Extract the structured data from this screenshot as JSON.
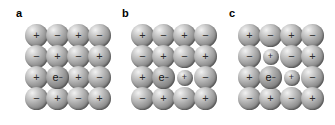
{
  "figure": {
    "width": 335,
    "height": 125,
    "background": "#ffffff"
  },
  "panels": [
    {
      "id": "panel-a",
      "label": "a",
      "left": 0,
      "rows": 4,
      "cols": 4,
      "cells": [
        [
          {
            "charge": "+",
            "size": "big"
          },
          {
            "charge": "−",
            "size": "big"
          },
          {
            "charge": "+",
            "size": "big"
          },
          {
            "charge": "−",
            "size": "big"
          }
        ],
        [
          {
            "charge": "−",
            "size": "big"
          },
          {
            "charge": "+",
            "size": "big"
          },
          {
            "charge": "−",
            "size": "big"
          },
          {
            "charge": "+",
            "size": "big"
          }
        ],
        [
          {
            "charge": "+",
            "size": "big"
          },
          {
            "charge": "e",
            "size": "big",
            "electron": true
          },
          {
            "charge": "+",
            "size": "big"
          },
          {
            "charge": "−",
            "size": "big"
          }
        ],
        [
          {
            "charge": "−",
            "size": "big"
          },
          {
            "charge": "+",
            "size": "big"
          },
          {
            "charge": "−",
            "size": "big"
          },
          {
            "charge": "+",
            "size": "big"
          }
        ]
      ]
    },
    {
      "id": "panel-b",
      "label": "b",
      "left": 106,
      "rows": 4,
      "cols": 4,
      "cells": [
        [
          {
            "charge": "+",
            "size": "big"
          },
          {
            "charge": "−",
            "size": "big"
          },
          {
            "charge": "+",
            "size": "big"
          },
          {
            "charge": "−",
            "size": "big"
          }
        ],
        [
          {
            "charge": "−",
            "size": "big"
          },
          {
            "charge": "+",
            "size": "big"
          },
          {
            "charge": "−",
            "size": "big"
          },
          {
            "charge": "+",
            "size": "big"
          }
        ],
        [
          {
            "charge": "+",
            "size": "big"
          },
          {
            "charge": "e",
            "size": "big",
            "electron": true
          },
          {
            "charge": "+",
            "size": "small"
          },
          {
            "charge": "−",
            "size": "big"
          }
        ],
        [
          {
            "charge": "−",
            "size": "big"
          },
          {
            "charge": "+",
            "size": "big"
          },
          {
            "charge": "−",
            "size": "big"
          },
          {
            "charge": "+",
            "size": "big"
          }
        ]
      ]
    },
    {
      "id": "panel-c",
      "label": "c",
      "left": 213,
      "rows": 4,
      "cols": 4,
      "cells": [
        [
          {
            "charge": "+",
            "size": "big"
          },
          {
            "charge": "−",
            "size": "big"
          },
          {
            "charge": "+",
            "size": "big"
          },
          {
            "charge": "−",
            "size": "big"
          }
        ],
        [
          {
            "charge": "−",
            "size": "big"
          },
          {
            "charge": "+",
            "size": "small"
          },
          {
            "charge": "−",
            "size": "big"
          },
          {
            "charge": "+",
            "size": "big"
          }
        ],
        [
          {
            "charge": "+",
            "size": "big"
          },
          {
            "charge": "e",
            "size": "big",
            "electron": true
          },
          {
            "charge": "+",
            "size": "small"
          },
          {
            "charge": "−",
            "size": "big"
          }
        ],
        [
          {
            "charge": "−",
            "size": "big"
          },
          {
            "charge": "+",
            "size": "big"
          },
          {
            "charge": "−",
            "size": "big"
          },
          {
            "charge": "+",
            "size": "big"
          }
        ]
      ]
    }
  ],
  "symbols": {
    "electron_glyph": "e",
    "electron_superscript": "−",
    "positive": "+",
    "negative": "−"
  },
  "geometry": {
    "cell_pitch_x": 21,
    "cell_pitch_y": 21,
    "big_diameter": 23,
    "small_diameter": 16,
    "lattice_left": 25,
    "lattice_top": 24
  },
  "colors": {
    "background": "#ffffff",
    "sphere_highlight": "#f2f2f2",
    "sphere_midtone": "#ababab",
    "sphere_shadow": "#6a6a6a",
    "text": "#000000",
    "sign": "#2a2a2a"
  }
}
